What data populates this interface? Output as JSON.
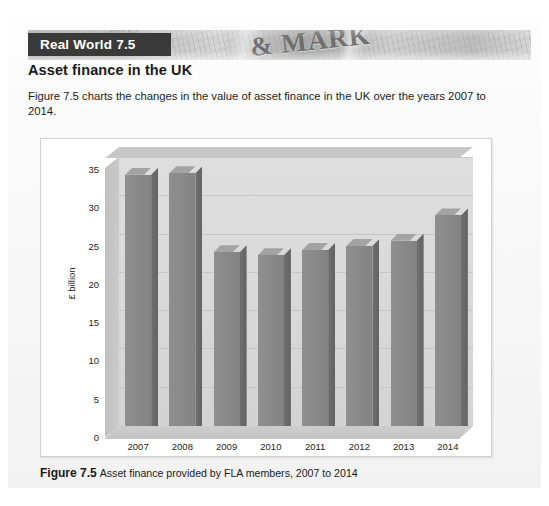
{
  "box": {
    "banner_label": "Real World 7.5",
    "subtitle": "Asset finance in the UK",
    "body_text": "Figure 7.5 charts the changes in the value of asset finance in the UK over the years 2007 to 2014.",
    "photo_headline": "& MARK",
    "photo_subhead": "OUR MONEY MATTERS"
  },
  "caption": {
    "figure_label": "Figure 7.5",
    "figure_text": "Asset finance provided by FLA members, 2007 to 2014"
  },
  "chart_data": {
    "type": "bar",
    "title": "",
    "xlabel": "",
    "ylabel": "£ billion",
    "categories": [
      "2007",
      "2008",
      "2009",
      "2010",
      "2011",
      "2012",
      "2013",
      "2014"
    ],
    "values": [
      32.8,
      33.0,
      22.7,
      22.3,
      23.0,
      23.5,
      24.2,
      27.5
    ],
    "yticks": [
      0,
      5,
      10,
      15,
      20,
      25,
      30,
      35
    ],
    "ytick_labels": [
      "0",
      "5",
      "10",
      "15",
      "20",
      "25",
      "30",
      "35"
    ],
    "ylim": [
      0,
      35
    ],
    "grid": true,
    "legend": "none",
    "style_3d": true,
    "colors": {
      "bar_face": "#8a8a8a",
      "bar_top": "#a3a3a3",
      "bar_side": "#696969",
      "wall": "#d9d9d9",
      "grid": "#c6c6c6",
      "text": "#1d1d1d"
    }
  }
}
